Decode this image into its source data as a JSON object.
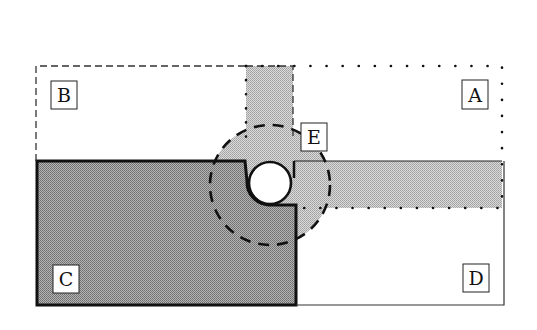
{
  "diagram": {
    "regions": [
      {
        "id": "A",
        "label": "A",
        "border": "dotted",
        "fill": "none"
      },
      {
        "id": "B",
        "label": "B",
        "border": "dashed",
        "fill": "none"
      },
      {
        "id": "C",
        "label": "C",
        "border": "solid-thick",
        "fill": "dark-gray"
      },
      {
        "id": "D",
        "label": "D",
        "border": "solid-thin",
        "fill": "none"
      },
      {
        "id": "E",
        "label": "E",
        "border": "dashed-circle",
        "fill": "light-gray"
      }
    ],
    "colors": {
      "dark_fill": "#9a9a9a",
      "light_fill": "#c4c4c4",
      "line": "#111111",
      "background": "#ffffff"
    }
  }
}
